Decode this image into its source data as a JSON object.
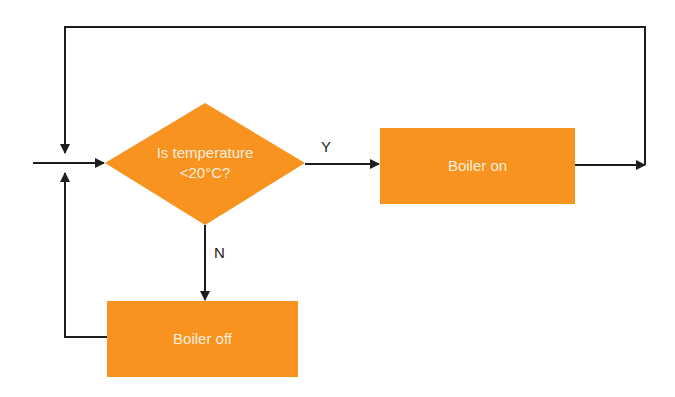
{
  "diagram": {
    "type": "flowchart",
    "colors": {
      "node_fill": "#f7931e",
      "node_text": "#fbeede",
      "line": "#1e1e1e",
      "background": "#ffffff"
    },
    "nodes": {
      "decision": {
        "shape": "diamond",
        "line1": "Is temperature",
        "line2": "<20°C?"
      },
      "boiler_on": {
        "shape": "rectangle",
        "label": "Boiler on"
      },
      "boiler_off": {
        "shape": "rectangle",
        "label": "Boiler off"
      }
    },
    "edges": {
      "yes_label": "Y",
      "no_label": "N"
    },
    "connections": [
      {
        "from": "entry",
        "to": "decision"
      },
      {
        "from": "decision",
        "to": "boiler_on",
        "label": "Y"
      },
      {
        "from": "decision",
        "to": "boiler_off",
        "label": "N"
      },
      {
        "from": "boiler_on",
        "to": "decision",
        "via": "top loop"
      },
      {
        "from": "boiler_off",
        "to": "decision",
        "via": "left loop"
      }
    ]
  }
}
